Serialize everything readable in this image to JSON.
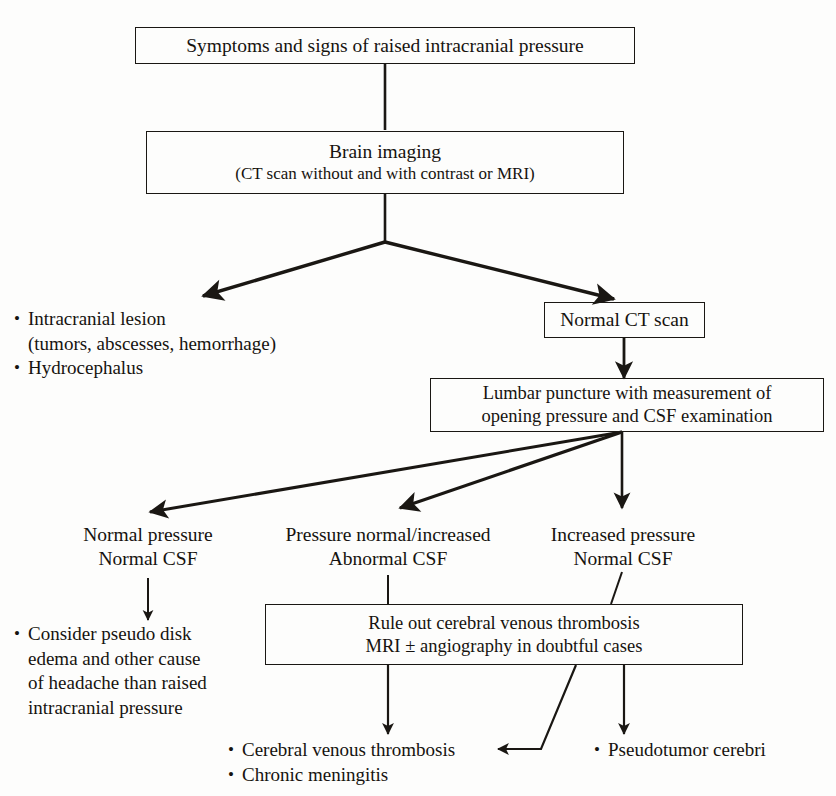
{
  "diagram": {
    "ink_color": "#1a1713",
    "background_color": "#fdfdfc"
  },
  "nodes": {
    "symptoms": {
      "line1": "Symptoms and signs of raised intracranial pressure"
    },
    "brain_imaging": {
      "line1": "Brain imaging",
      "line2": "(CT scan without and with contrast or MRI)"
    },
    "normal_ct": {
      "line1": "Normal CT scan"
    },
    "lumbar_puncture": {
      "line1": "Lumbar puncture with measurement of",
      "line2": "opening pressure and CSF examination"
    },
    "rule_out": {
      "line1": "Rule out cerebral venous thrombosis",
      "line2": "MRI ± angiography in doubtful cases"
    }
  },
  "labels": {
    "normal_pressure": {
      "line1": "Normal pressure",
      "line2": "Normal CSF"
    },
    "pressure_normal_increased": {
      "line1": "Pressure normal/increased",
      "line2": "Abnormal CSF"
    },
    "increased_pressure": {
      "line1": "Increased pressure",
      "line2": "Normal CSF"
    }
  },
  "bullet_lists": {
    "lesion_findings": {
      "items": [
        {
          "text": "Intracranial lesion",
          "continuation": "(tumors, abscesses, hemorrhage)"
        },
        {
          "text": "Hydrocephalus",
          "continuation": ""
        }
      ]
    },
    "pseudo_disk": {
      "items": [
        {
          "text": "Consider pseudo disk",
          "lines": [
            "edema and other cause",
            "of headache than raised",
            "intracranial pressure"
          ]
        }
      ]
    },
    "thrombosis_outcomes": {
      "items": [
        {
          "text": "Cerebral venous thrombosis"
        },
        {
          "text": "Chronic meningitis"
        }
      ]
    },
    "pseudotumor": {
      "items": [
        {
          "text": "Pseudotumor cerebri"
        }
      ]
    }
  },
  "bullet_glyph": "•"
}
